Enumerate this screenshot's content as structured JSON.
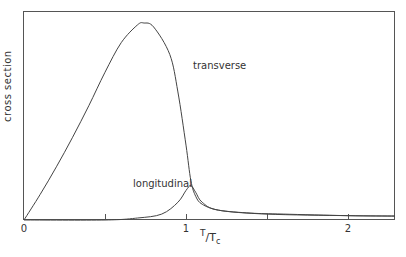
{
  "chart_data": {
    "type": "line",
    "title": "",
    "xlabel": "T/Tc",
    "ylabel": "cross section",
    "xlim": [
      0,
      2.29
    ],
    "ylim": [
      0,
      1.05
    ],
    "grid": false,
    "x_ticks": [
      0,
      0.5,
      1,
      1.5,
      2
    ],
    "x_tick_labels": [
      "0",
      "",
      "1",
      "",
      "2"
    ],
    "series": [
      {
        "name": "transverse",
        "x": [
          0,
          0.1,
          0.2,
          0.3,
          0.4,
          0.5,
          0.6,
          0.7,
          0.74,
          0.8,
          0.9,
          0.95,
          1.0,
          1.03,
          1.06,
          1.1,
          1.2,
          1.4,
          1.6,
          2.0,
          2.29
        ],
        "values": [
          0,
          0.13,
          0.27,
          0.42,
          0.58,
          0.75,
          0.9,
          0.99,
          1.0,
          0.98,
          0.84,
          0.65,
          0.38,
          0.2,
          0.12,
          0.08,
          0.05,
          0.035,
          0.03,
          0.022,
          0.02
        ]
      },
      {
        "name": "longitudinal",
        "x": [
          0,
          0.5,
          0.7,
          0.85,
          0.95,
          1.0,
          1.03,
          1.06,
          1.1,
          1.2,
          1.5,
          2.0,
          2.29
        ],
        "values": [
          0,
          0,
          0.01,
          0.03,
          0.09,
          0.15,
          0.175,
          0.14,
          0.09,
          0.05,
          0.03,
          0.022,
          0.02
        ]
      }
    ],
    "annotations": [
      {
        "text": "transverse",
        "x": 1.05,
        "y": 0.8
      },
      {
        "text": "longitudinal",
        "x": 0.67,
        "y": 0.16
      }
    ]
  },
  "labels": {
    "ylabel": "cross section",
    "x_num": "T",
    "x_den": "T",
    "x_den_sub": "c",
    "transverse": "transverse",
    "longitudinal": "longitudinal",
    "tick_0": "0",
    "tick_1": "1",
    "tick_2": "2"
  }
}
